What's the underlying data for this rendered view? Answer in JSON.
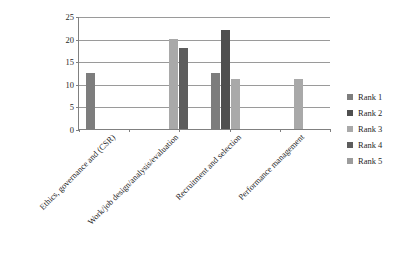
{
  "chart_data": {
    "type": "bar",
    "title": "",
    "subtitle": "",
    "xlabel": "",
    "ylabel": "",
    "ylim": [
      0,
      25
    ],
    "yticks": [
      0,
      5,
      10,
      15,
      20,
      25
    ],
    "grid": true,
    "legend_position": "right",
    "categories": [
      "Ethics, governance and (CSR)",
      "Work/job design/analysis/evaluation",
      "Recruitment and selection",
      "Performance management"
    ],
    "series": [
      {
        "name": "Rank 1",
        "color": "#7d7d7d",
        "values": [
          12.5,
          0,
          12.5,
          0
        ]
      },
      {
        "name": "Rank 2",
        "color": "#4f4f4f",
        "values": [
          0,
          0,
          22,
          0
        ]
      },
      {
        "name": "Rank 3",
        "color": "#a9a9a9",
        "values": [
          0,
          20,
          11,
          11
        ]
      },
      {
        "name": "Rank 4",
        "color": "#5d5d5d",
        "values": [
          0,
          18,
          0,
          0
        ]
      },
      {
        "name": "Rank 5",
        "color": "#9c9c9c",
        "values": [
          0,
          0,
          0,
          0
        ]
      }
    ],
    "axis_color": "#808080",
    "gridline_color": "#9a9a9a",
    "background": "#ffffff"
  }
}
